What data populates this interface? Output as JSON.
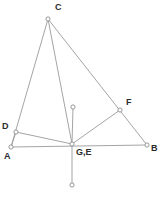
{
  "figure": {
    "type": "geometry-diagram",
    "width": 161,
    "height": 202,
    "background_color": "#ffffff",
    "line_color": "#9a9a9a",
    "vertex_fill_color": "#ffffff",
    "vertex_stroke_color": "#8d8d8d",
    "label_color": "#2b2b2b",
    "points": [
      {
        "id": "C",
        "label": "C",
        "x": 48,
        "y": 19,
        "label_x": 55,
        "label_y": 3
      },
      {
        "id": "P1",
        "label": "",
        "x": 73,
        "y": 107,
        "label_x": 0,
        "label_y": 0
      },
      {
        "id": "F",
        "label": "F",
        "x": 120,
        "y": 110,
        "label_x": 126,
        "label_y": 98
      },
      {
        "id": "D",
        "label": "D",
        "x": 16,
        "y": 132,
        "label_x": 2,
        "label_y": 122
      },
      {
        "id": "GE",
        "label": "G,E",
        "x": 72,
        "y": 144,
        "label_x": 76,
        "label_y": 148
      },
      {
        "id": "A",
        "label": "A",
        "x": 11,
        "y": 147,
        "label_x": 4,
        "label_y": 152
      },
      {
        "id": "B",
        "label": "B",
        "x": 147,
        "y": 145,
        "label_x": 151,
        "label_y": 144
      },
      {
        "id": "P2",
        "label": "",
        "x": 72,
        "y": 185,
        "label_x": 0,
        "label_y": 0
      }
    ],
    "edges": [
      {
        "from": "C",
        "to": "A",
        "name": "segment-C-A"
      },
      {
        "from": "C",
        "to": "GE",
        "name": "segment-C-GE"
      },
      {
        "from": "C",
        "to": "B",
        "name": "segment-C-B"
      },
      {
        "from": "A",
        "to": "D",
        "name": "segment-A-D"
      },
      {
        "from": "D",
        "to": "GE",
        "name": "segment-D-GE"
      },
      {
        "from": "A",
        "to": "B",
        "name": "segment-A-B"
      },
      {
        "from": "GE",
        "to": "F",
        "name": "segment-GE-F"
      },
      {
        "from": "P1",
        "to": "GE",
        "name": "segment-P1-GE"
      },
      {
        "from": "GE",
        "to": "P2",
        "name": "segment-GE-P2"
      }
    ],
    "vertex_radius": 2.1
  }
}
